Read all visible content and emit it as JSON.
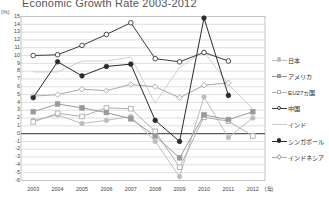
{
  "chart_data": {
    "type": "line",
    "title": "Economic Growth Rate 2003-2012",
    "xlabel": "(年)",
    "ylabel": "(%)",
    "x": [
      "2003",
      "2004",
      "2005",
      "2006",
      "2007",
      "2008",
      "2009",
      "2010",
      "2011",
      "2012"
    ],
    "ylim": [
      -6,
      15
    ],
    "yticks": [
      "15",
      "14",
      "13",
      "12",
      "11",
      "10",
      "9",
      "8",
      "7",
      "6",
      "5",
      "4",
      "3",
      "2",
      "1",
      "0",
      "-1",
      "-2",
      "-3",
      "-4",
      "-5",
      "-6"
    ],
    "grid": true,
    "legend_position": "right",
    "series": [
      {
        "name": "日本",
        "marker": "circle-filled",
        "color": "#bdbdbd",
        "values": [
          1.7,
          2.4,
          1.3,
          1.7,
          2.2,
          -1.0,
          -5.5,
          4.7,
          -0.5,
          2.0
        ]
      },
      {
        "name": "アメリカ",
        "marker": "square-filled",
        "color": "#9a9a9a",
        "values": [
          2.8,
          3.8,
          3.3,
          2.7,
          1.9,
          -0.3,
          -3.1,
          2.4,
          1.8,
          2.8
        ]
      },
      {
        "name": "EU27ヵ国",
        "marker": "square-open",
        "color": "#b0b0b0",
        "values": [
          1.5,
          2.6,
          2.2,
          3.3,
          3.2,
          0.3,
          -4.3,
          2.1,
          1.6,
          -0.3
        ]
      },
      {
        "name": "中国",
        "marker": "circle-open",
        "color": "#3b3b3b",
        "values": [
          10.0,
          10.1,
          11.3,
          12.7,
          14.2,
          9.6,
          9.2,
          10.4,
          9.3,
          null
        ]
      },
      {
        "name": "インド",
        "marker": "none",
        "color": "#c9c9c9",
        "values": [
          7.9,
          7.9,
          9.3,
          9.3,
          9.8,
          3.9,
          8.5,
          10.5,
          6.3,
          3.2
        ]
      },
      {
        "name": "シンガポール",
        "marker": "circle-filled-dark",
        "color": "#2a2a2a",
        "values": [
          4.6,
          9.2,
          7.4,
          8.6,
          8.9,
          1.7,
          -1.0,
          14.8,
          4.9,
          null
        ]
      },
      {
        "name": "インドネシア",
        "marker": "diamond-open",
        "color": "#a8a8a8",
        "values": [
          4.8,
          5.0,
          5.7,
          5.5,
          6.3,
          6.0,
          4.6,
          6.2,
          6.5,
          null
        ]
      }
    ]
  },
  "legend": {
    "items": [
      {
        "label": "日本"
      },
      {
        "label": "アメリカ"
      },
      {
        "label": "EU27ヵ国"
      },
      {
        "label": "中国"
      },
      {
        "label": "インド"
      },
      {
        "label": "シンガポール"
      },
      {
        "label": "インドネシア"
      }
    ]
  },
  "colors": {
    "grid": "#c4c4c4",
    "zero_line": "#5a5a5a",
    "plot_border": "#9a9a9a",
    "text": "#3a3a3a"
  }
}
